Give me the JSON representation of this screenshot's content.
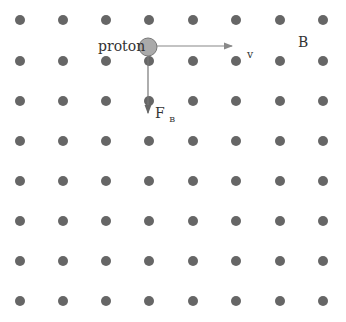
{
  "diagram": {
    "field": {
      "label": "B",
      "direction": "out-of-page",
      "symbol": "dot-icon",
      "color": "#666666",
      "grid": {
        "columns": 8,
        "rows": 8,
        "x_positions": [
          20,
          63,
          106,
          149,
          193,
          236,
          280,
          323
        ],
        "y_positions": [
          20,
          61,
          101,
          141,
          181,
          221,
          261,
          301
        ],
        "dot_radius": 5
      }
    },
    "particle": {
      "label": "proton",
      "center": [
        148,
        47
      ],
      "radius": 9,
      "fill": "#aaaaaa",
      "stroke": "#777777"
    },
    "velocity": {
      "label": "v",
      "from": [
        157,
        46
      ],
      "to": [
        232,
        46
      ],
      "color": "#888888"
    },
    "force": {
      "label": "F",
      "subscript": "B",
      "from": [
        148,
        56
      ],
      "to": [
        148,
        113
      ],
      "color": "#777777"
    }
  }
}
